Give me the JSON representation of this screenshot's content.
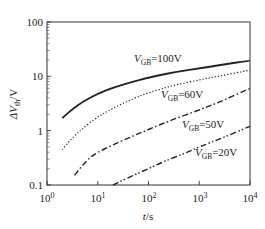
{
  "chart_data": {
    "type": "line",
    "title": "",
    "xlabel": "t/s",
    "ylabel": "ΔV_th/V",
    "xscale": "log",
    "yscale": "log",
    "xlim": [
      1,
      10000
    ],
    "ylim": [
      0.1,
      100
    ],
    "x_ticks": [
      "10^0",
      "10^1",
      "10^2",
      "10^3",
      "10^4"
    ],
    "y_ticks": [
      "0.1",
      "1",
      "10",
      "100"
    ],
    "grid": false,
    "legend_position": "inline labels",
    "series": [
      {
        "name": "V_GB=100V",
        "style": "solid",
        "x": [
          2,
          3,
          5,
          10,
          20,
          50,
          100,
          300,
          1000,
          3000,
          10000
        ],
        "values": [
          1.7,
          2.4,
          3.4,
          4.8,
          6.2,
          8.0,
          9.5,
          11.8,
          14.0,
          16.5,
          19.5
        ]
      },
      {
        "name": "V_GB=60V",
        "style": "dotted",
        "x": [
          2,
          3,
          5,
          10,
          20,
          50,
          100,
          300,
          1000,
          3000,
          10000
        ],
        "values": [
          0.45,
          0.7,
          1.1,
          1.8,
          2.6,
          3.9,
          5.0,
          6.8,
          8.6,
          10.5,
          13.0
        ]
      },
      {
        "name": "V_GB=50V",
        "style": "dash-dot",
        "x": [
          3.5,
          5,
          7,
          10,
          20,
          50,
          100,
          300,
          1000,
          3000,
          10000
        ],
        "values": [
          0.15,
          0.23,
          0.32,
          0.4,
          0.55,
          0.8,
          1.05,
          1.6,
          2.4,
          3.6,
          6.0
        ]
      },
      {
        "name": "V_GB=20V",
        "style": "dash-dot-dot",
        "x": [
          20,
          30,
          50,
          100,
          200,
          500,
          1000,
          3000,
          10000
        ],
        "values": [
          0.1,
          0.12,
          0.15,
          0.2,
          0.27,
          0.38,
          0.5,
          0.75,
          1.2
        ]
      }
    ]
  },
  "labels": {
    "y_axis": {
      "prefix": "ΔV",
      "sub": "th",
      "suffix": "/V"
    },
    "x_axis": {
      "t": "t",
      "unit": "/s"
    },
    "series_labels": [
      {
        "v": "V",
        "sub": "GB",
        "val": "=100V"
      },
      {
        "v": "V",
        "sub": "GB",
        "val": "=60V"
      },
      {
        "v": "V",
        "sub": "GB",
        "val": "=50V"
      },
      {
        "v": "V",
        "sub": "GB",
        "val": "=20V"
      }
    ],
    "y_ticks": [
      "100",
      "10",
      "1",
      "0.1"
    ],
    "x_ticks": [
      {
        "base": "10",
        "exp": "0"
      },
      {
        "base": "10",
        "exp": "1"
      },
      {
        "base": "10",
        "exp": "2"
      },
      {
        "base": "10",
        "exp": "3"
      },
      {
        "base": "10",
        "exp": "4"
      }
    ]
  }
}
